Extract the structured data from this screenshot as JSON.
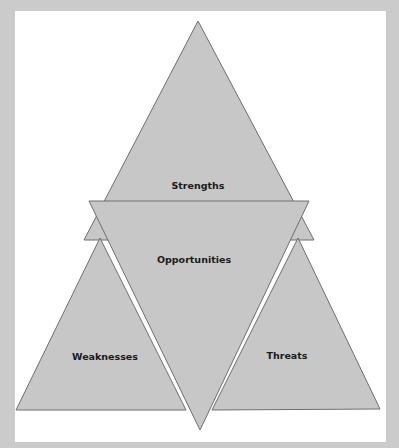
{
  "diagram": {
    "colors": {
      "page_background": "#cbcbcb",
      "panel_background": "#ffffff",
      "triangle_fill": "#c7c7c7",
      "triangle_stroke": "#6e6e6e",
      "label_color": "#1a1a1a"
    },
    "shapes": [
      {
        "id": "strengths",
        "label": "Strengths",
        "orientation": "up"
      },
      {
        "id": "weaknesses",
        "label": "Weaknesses",
        "orientation": "up"
      },
      {
        "id": "threats",
        "label": "Threats",
        "orientation": "up"
      },
      {
        "id": "opportunities",
        "label": "Opportunities",
        "orientation": "down"
      }
    ],
    "labels": {
      "strengths": "Strengths",
      "opportunities": "Opportunities",
      "weaknesses": "Weaknesses",
      "threats": "Threats"
    }
  }
}
